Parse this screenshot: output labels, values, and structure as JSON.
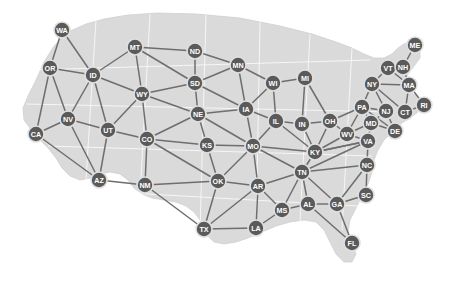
{
  "figure": {
    "type": "node-link-graph",
    "width": 450,
    "height": 291,
    "background_color": "#ffffff",
    "map_fill_color": "#d9d9d9",
    "map_stroke_color": "#c9c9c9",
    "node_fill_color": "#5a5a5a",
    "node_ring_color": "#e0e0e0",
    "node_label_color": "#ffffff",
    "edge_color": "#6e6e6e",
    "node_radius": 8,
    "node_ring_width": 1.6,
    "edge_width": 1.5,
    "label_font_size": 7.2
  },
  "chart_data": {
    "type": "scatter",
    "xlabel": "",
    "ylabel": "",
    "xlim": [
      0,
      450
    ],
    "ylim": [
      291,
      0
    ],
    "grid": false,
    "legend": "none",
    "node_count": 49,
    "edge_count": 105,
    "nodes": [
      {
        "id": "WA",
        "label": "WA",
        "x": 62,
        "y": 30
      },
      {
        "id": "MT",
        "label": "MT",
        "x": 135,
        "y": 47
      },
      {
        "id": "ND",
        "label": "ND",
        "x": 195,
        "y": 51
      },
      {
        "id": "MN",
        "label": "MN",
        "x": 238,
        "y": 65
      },
      {
        "id": "OR",
        "label": "OR",
        "x": 50,
        "y": 68
      },
      {
        "id": "ID",
        "label": "ID",
        "x": 93,
        "y": 75
      },
      {
        "id": "SD",
        "label": "SD",
        "x": 195,
        "y": 83
      },
      {
        "id": "WI",
        "label": "WI",
        "x": 273,
        "y": 83
      },
      {
        "id": "MI",
        "label": "MI",
        "x": 305,
        "y": 78
      },
      {
        "id": "ME",
        "label": "ME",
        "x": 415,
        "y": 45
      },
      {
        "id": "VT",
        "label": "VT",
        "x": 388,
        "y": 68
      },
      {
        "id": "NH",
        "label": "NH",
        "x": 403,
        "y": 67
      },
      {
        "id": "WY",
        "label": "WY",
        "x": 142,
        "y": 94
      },
      {
        "id": "IA",
        "label": "IA",
        "x": 246,
        "y": 109
      },
      {
        "id": "NY",
        "label": "NY",
        "x": 372,
        "y": 84
      },
      {
        "id": "MA",
        "label": "MA",
        "x": 409,
        "y": 85
      },
      {
        "id": "NE",
        "label": "NE",
        "x": 198,
        "y": 114
      },
      {
        "id": "IL",
        "label": "IL",
        "x": 276,
        "y": 121
      },
      {
        "id": "IN",
        "label": "IN",
        "x": 302,
        "y": 124
      },
      {
        "id": "OH",
        "label": "OH",
        "x": 330,
        "y": 121
      },
      {
        "id": "PA",
        "label": "PA",
        "x": 362,
        "y": 107
      },
      {
        "id": "NJ",
        "label": "NJ",
        "x": 386,
        "y": 111
      },
      {
        "id": "CT",
        "label": "CT",
        "x": 405,
        "y": 112
      },
      {
        "id": "RI",
        "label": "RI",
        "x": 424,
        "y": 105
      },
      {
        "id": "NV",
        "label": "NV",
        "x": 68,
        "y": 119
      },
      {
        "id": "UT",
        "label": "UT",
        "x": 108,
        "y": 130
      },
      {
        "id": "CA",
        "label": "CA",
        "x": 36,
        "y": 134
      },
      {
        "id": "CO",
        "label": "CO",
        "x": 147,
        "y": 139
      },
      {
        "id": "KS",
        "label": "KS",
        "x": 207,
        "y": 145
      },
      {
        "id": "MO",
        "label": "MO",
        "x": 253,
        "y": 146
      },
      {
        "id": "MD",
        "label": "MD",
        "x": 371,
        "y": 123
      },
      {
        "id": "WV",
        "label": "WV",
        "x": 347,
        "y": 134
      },
      {
        "id": "DE",
        "label": "DE",
        "x": 395,
        "y": 131
      },
      {
        "id": "VA",
        "label": "VA",
        "x": 368,
        "y": 141
      },
      {
        "id": "KY",
        "label": "KY",
        "x": 315,
        "y": 152
      },
      {
        "id": "NC",
        "label": "NC",
        "x": 367,
        "y": 165
      },
      {
        "id": "AZ",
        "label": "AZ",
        "x": 99,
        "y": 180
      },
      {
        "id": "NM",
        "label": "NM",
        "x": 145,
        "y": 185
      },
      {
        "id": "OK",
        "label": "OK",
        "x": 218,
        "y": 181
      },
      {
        "id": "AR",
        "label": "AR",
        "x": 258,
        "y": 186
      },
      {
        "id": "TN",
        "label": "TN",
        "x": 302,
        "y": 172
      },
      {
        "id": "SC",
        "label": "SC",
        "x": 366,
        "y": 195
      },
      {
        "id": "MS",
        "label": "MS",
        "x": 282,
        "y": 210
      },
      {
        "id": "AL",
        "label": "AL",
        "x": 308,
        "y": 204
      },
      {
        "id": "GA",
        "label": "GA",
        "x": 337,
        "y": 204
      },
      {
        "id": "TX",
        "label": "TX",
        "x": 204,
        "y": 229
      },
      {
        "id": "LA",
        "label": "LA",
        "x": 256,
        "y": 228
      },
      {
        "id": "FL",
        "label": "FL",
        "x": 352,
        "y": 243
      }
    ],
    "edges": [
      [
        "WA",
        "OR"
      ],
      [
        "WA",
        "ID"
      ],
      [
        "OR",
        "ID"
      ],
      [
        "OR",
        "NV"
      ],
      [
        "OR",
        "CA"
      ],
      [
        "ID",
        "NV"
      ],
      [
        "ID",
        "UT"
      ],
      [
        "ID",
        "WY"
      ],
      [
        "ID",
        "MT"
      ],
      [
        "MT",
        "WY"
      ],
      [
        "MT",
        "ND"
      ],
      [
        "MT",
        "SD"
      ],
      [
        "ND",
        "SD"
      ],
      [
        "ND",
        "MN"
      ],
      [
        "MN",
        "SD"
      ],
      [
        "MN",
        "IA"
      ],
      [
        "MN",
        "WI"
      ],
      [
        "SD",
        "NE"
      ],
      [
        "SD",
        "WY"
      ],
      [
        "SD",
        "IA"
      ],
      [
        "WY",
        "NE"
      ],
      [
        "WY",
        "CO"
      ],
      [
        "WY",
        "UT"
      ],
      [
        "NV",
        "CA"
      ],
      [
        "NV",
        "UT"
      ],
      [
        "NV",
        "AZ"
      ],
      [
        "CA",
        "AZ"
      ],
      [
        "UT",
        "CO"
      ],
      [
        "UT",
        "AZ"
      ],
      [
        "CO",
        "NE"
      ],
      [
        "CO",
        "KS"
      ],
      [
        "CO",
        "NM"
      ],
      [
        "CO",
        "OK"
      ],
      [
        "NE",
        "IA"
      ],
      [
        "NE",
        "KS"
      ],
      [
        "NE",
        "MO"
      ],
      [
        "IA",
        "WI"
      ],
      [
        "IA",
        "IL"
      ],
      [
        "IA",
        "MO"
      ],
      [
        "WI",
        "IL"
      ],
      [
        "WI",
        "MI"
      ],
      [
        "MI",
        "IN"
      ],
      [
        "MI",
        "OH"
      ],
      [
        "IL",
        "IN"
      ],
      [
        "IL",
        "MO"
      ],
      [
        "IL",
        "KY"
      ],
      [
        "IN",
        "OH"
      ],
      [
        "IN",
        "KY"
      ],
      [
        "OH",
        "KY"
      ],
      [
        "OH",
        "PA"
      ],
      [
        "OH",
        "WV"
      ],
      [
        "PA",
        "NY"
      ],
      [
        "PA",
        "NJ"
      ],
      [
        "PA",
        "MD"
      ],
      [
        "PA",
        "WV"
      ],
      [
        "PA",
        "DE"
      ],
      [
        "NY",
        "VT"
      ],
      [
        "NY",
        "MA"
      ],
      [
        "NY",
        "NJ"
      ],
      [
        "NY",
        "CT"
      ],
      [
        "VT",
        "NH"
      ],
      [
        "VT",
        "MA"
      ],
      [
        "NH",
        "ME"
      ],
      [
        "NH",
        "MA"
      ],
      [
        "MA",
        "CT"
      ],
      [
        "MA",
        "RI"
      ],
      [
        "CT",
        "RI"
      ],
      [
        "NJ",
        "DE"
      ],
      [
        "NJ",
        "MD"
      ],
      [
        "MD",
        "DE"
      ],
      [
        "MD",
        "VA"
      ],
      [
        "MD",
        "WV"
      ],
      [
        "WV",
        "VA"
      ],
      [
        "WV",
        "KY"
      ],
      [
        "VA",
        "KY"
      ],
      [
        "VA",
        "NC"
      ],
      [
        "VA",
        "TN"
      ],
      [
        "KY",
        "TN"
      ],
      [
        "KY",
        "MO"
      ],
      [
        "KY",
        "VA"
      ],
      [
        "NC",
        "SC"
      ],
      [
        "NC",
        "GA"
      ],
      [
        "NC",
        "TN"
      ],
      [
        "KS",
        "MO"
      ],
      [
        "KS",
        "OK"
      ],
      [
        "MO",
        "OK"
      ],
      [
        "MO",
        "AR"
      ],
      [
        "MO",
        "TN"
      ],
      [
        "NM",
        "AZ"
      ],
      [
        "NM",
        "TX"
      ],
      [
        "NM",
        "OK"
      ],
      [
        "OK",
        "AR"
      ],
      [
        "OK",
        "TX"
      ],
      [
        "AR",
        "TX"
      ],
      [
        "AR",
        "LA"
      ],
      [
        "AR",
        "MS"
      ],
      [
        "AR",
        "TN"
      ],
      [
        "TN",
        "MS"
      ],
      [
        "TN",
        "AL"
      ],
      [
        "TN",
        "GA"
      ],
      [
        "MS",
        "AL"
      ],
      [
        "MS",
        "LA"
      ],
      [
        "AL",
        "GA"
      ],
      [
        "AL",
        "FL"
      ],
      [
        "GA",
        "SC"
      ],
      [
        "GA",
        "FL"
      ],
      [
        "TX",
        "LA"
      ]
    ]
  }
}
